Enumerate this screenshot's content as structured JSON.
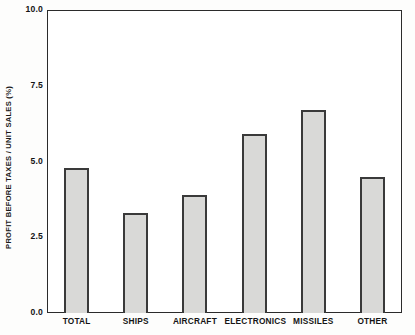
{
  "chart_data": {
    "type": "bar",
    "title": "",
    "xlabel": "",
    "ylabel": "PROFIT BEFORE TAXES / UNIT SALES (%)",
    "categories": [
      "TOTAL",
      "SHIPS",
      "AIRCRAFT",
      "ELECTRONICS",
      "MISSILES",
      "OTHER"
    ],
    "values": [
      4.8,
      3.3,
      3.9,
      5.9,
      6.7,
      4.5
    ],
    "ylim": [
      0.0,
      10.0
    ],
    "yticks": [
      0.0,
      2.5,
      5.0,
      7.5,
      10.0
    ],
    "ytick_labels": [
      "0.0",
      "2.5",
      "5.0",
      "7.5",
      "10.0"
    ],
    "grid": false,
    "legend": null,
    "bar_fill_color": "#d9d9d7",
    "bar_edge_color": "#3a3a3a",
    "frame_color": "#2b2b2b",
    "background_color": "#ffffff"
  }
}
